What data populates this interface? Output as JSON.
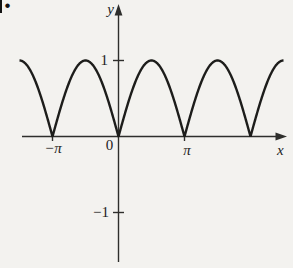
{
  "figure": {
    "corner_fragment": ".",
    "background_color": "#f3f2ef",
    "curve_color": "#1d1d1b",
    "axis_color": "#2e2e2c"
  },
  "chart_data": {
    "type": "line",
    "title": "",
    "function": "y = |sin(x)|",
    "xlabel": "x",
    "ylabel": "y",
    "x_range": [
      -4.712,
      7.854
    ],
    "x_axis_range": [
      -4.6,
      8.0
    ],
    "y_axis_range": [
      -1.67,
      1.73
    ],
    "grid": false,
    "legend": "none",
    "x_ticks": [
      {
        "value": -3.14159,
        "label": "−π"
      },
      {
        "value": 0,
        "label": "0"
      },
      {
        "value": 3.14159,
        "label": "π"
      }
    ],
    "y_ticks": [
      {
        "value": 1,
        "label": "1"
      },
      {
        "value": -1,
        "label": "−1"
      }
    ],
    "zeros_at_x": [
      -3.142,
      0,
      3.142,
      6.283
    ],
    "peak_value": 1,
    "peaks_at_x": [
      -4.712,
      -1.571,
      1.571,
      4.712,
      7.854
    ],
    "samples": {
      "x": [
        -4.712,
        -4.32,
        -3.927,
        -3.534,
        -3.142,
        -2.749,
        -2.356,
        -1.963,
        -1.571,
        -1.178,
        -0.785,
        -0.393,
        0,
        0.393,
        0.785,
        1.178,
        1.571,
        1.963,
        2.356,
        2.749,
        3.142,
        3.534,
        3.927,
        4.32,
        4.712,
        5.105,
        5.498,
        5.89,
        6.283,
        6.676,
        7.069,
        7.461,
        7.854
      ],
      "y": [
        1,
        0.924,
        0.707,
        0.383,
        0,
        0.383,
        0.707,
        0.924,
        1,
        0.924,
        0.707,
        0.383,
        0,
        0.383,
        0.707,
        0.924,
        1,
        0.924,
        0.707,
        0.383,
        0,
        0.383,
        0.707,
        0.924,
        1,
        0.924,
        0.707,
        0.383,
        0,
        0.383,
        0.707,
        0.924,
        1
      ]
    }
  }
}
